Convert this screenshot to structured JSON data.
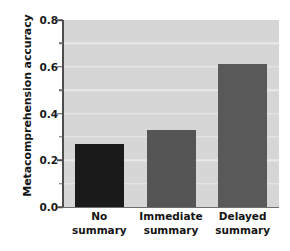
{
  "chart_data": {
    "type": "bar",
    "title": "",
    "xlabel": "",
    "ylabel": "Metacomprehension accuracy",
    "categories": [
      "No summary",
      "Immediate summary",
      "Delayed summary"
    ],
    "category_lines": [
      [
        "No",
        "summary"
      ],
      [
        "Immediate",
        "summary"
      ],
      [
        "Delayed",
        "summary"
      ]
    ],
    "values": [
      0.27,
      0.33,
      0.61
    ],
    "bar_colors": [
      "#1a1a1a",
      "#555555",
      "#595959"
    ],
    "ylim": [
      0.0,
      0.8
    ],
    "y_major_ticks": [
      0.0,
      0.2,
      0.4,
      0.6,
      0.8
    ],
    "y_tick_labels": [
      "0.0",
      "0.2",
      "0.4",
      "0.6",
      "0.8"
    ],
    "y_minor_ticks": [
      0.1,
      0.3,
      0.5,
      0.7
    ],
    "gridlines": [
      0.1,
      0.2,
      0.3,
      0.4,
      0.5,
      0.6,
      0.7
    ],
    "grid": true,
    "legend": false,
    "plot_background": "#d6d6d6",
    "gridline_color": "#e9e9e9",
    "figure_background": "#ffffff"
  }
}
